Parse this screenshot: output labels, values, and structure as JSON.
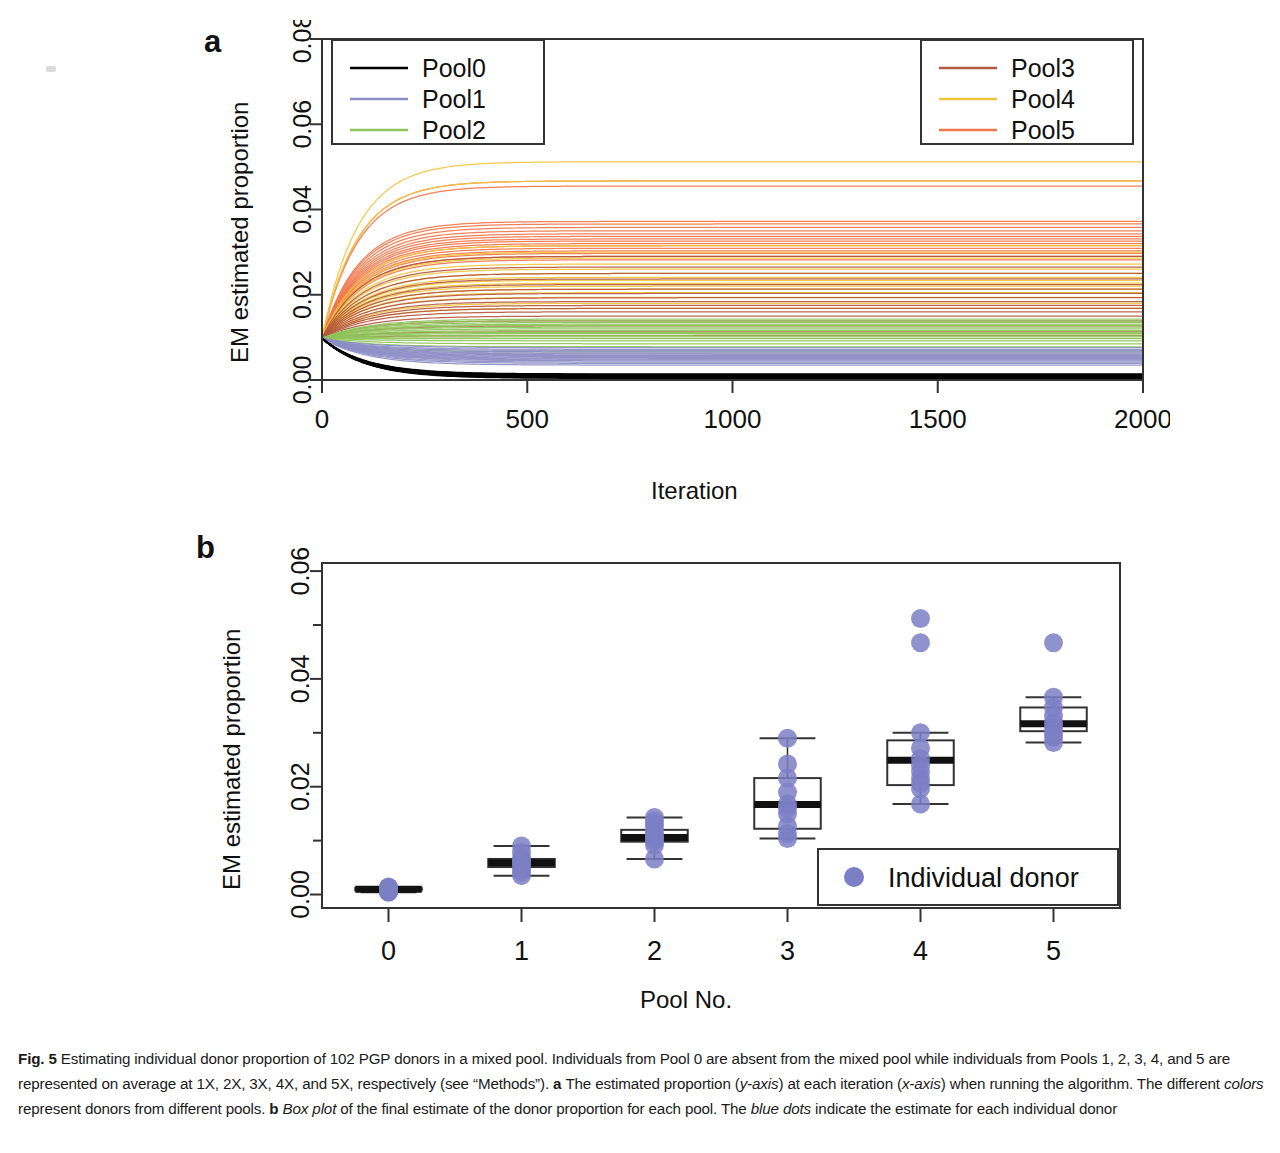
{
  "figure": {
    "label": "Fig. 5",
    "caption_parts": [
      {
        "text": "Fig. 5 ",
        "style": "bold"
      },
      {
        "text": "Estimating individual donor proportion of 102 PGP donors in a mixed pool. Individuals from Pool 0 are absent from the mixed pool while individuals from Pools 1, 2, 3, 4, and 5 are represented on average at 1X, 2X, 3X, 4X, and 5X, respectively (see “Methods”). ",
        "style": "normal"
      },
      {
        "text": "a ",
        "style": "bold"
      },
      {
        "text": "The estimated proportion (",
        "style": "normal"
      },
      {
        "text": "y-axis",
        "style": "italic"
      },
      {
        "text": ") at each iteration (",
        "style": "normal"
      },
      {
        "text": "x-axis",
        "style": "italic"
      },
      {
        "text": ") when running the algorithm. The different ",
        "style": "normal"
      },
      {
        "text": "colors",
        "style": "italic"
      },
      {
        "text": " represent donors from different pools. ",
        "style": "normal"
      },
      {
        "text": "b ",
        "style": "bold"
      },
      {
        "text": "Box plot",
        "style": "italic"
      },
      {
        "text": " of the final estimate of the donor proportion for each pool. The ",
        "style": "normal"
      },
      {
        "text": "blue dots",
        "style": "italic"
      },
      {
        "text": " indicate the estimate for each individual donor",
        "style": "normal"
      }
    ],
    "caption_plain": "Fig. 5 Estimating individual donor proportion of 102 PGP donors in a mixed pool. Individuals from Pool 0 are absent from the mixed pool while individuals from Pools 1, 2, 3, 4, and 5 are represented on average at 1X, 2X, 3X, 4X, and 5X, respectively (see “Methods”). a The estimated proportion (y-axis) at each iteration (x-axis) when running the algorithm. The different colors represent donors from different pools. b Box plot of the final estimate of the donor proportion for each pool. The blue dots indicate the estimate for each individual donor"
  },
  "panel_a": {
    "letter": "a",
    "ylabel": "EM estimated proportion",
    "xlabel": "Iteration",
    "legend_left": [
      {
        "label": "Pool0",
        "color": "#000000"
      },
      {
        "label": "Pool1",
        "color": "#8d8ec6"
      },
      {
        "label": "Pool2",
        "color": "#8ec45a"
      }
    ],
    "legend_right": [
      {
        "label": "Pool3",
        "color": "#b5583f"
      },
      {
        "label": "Pool4",
        "color": "#f2c53d"
      },
      {
        "label": "Pool5",
        "color": "#f0764a"
      }
    ]
  },
  "panel_b": {
    "letter": "b",
    "ylabel": "EM estimated proportion",
    "xlabel": "Pool No.",
    "legend": {
      "label": "Individual donor",
      "color": "#7b7fc4"
    }
  },
  "chart_data": [
    {
      "type": "line",
      "panel": "a",
      "title": "",
      "xlabel": "Iteration",
      "ylabel": "EM estimated proportion",
      "xlim": [
        0,
        2000
      ],
      "ylim": [
        0.0,
        0.08
      ],
      "xticks": [
        0,
        500,
        1000,
        1500,
        2000
      ],
      "xticklabels": [
        "0",
        "500",
        "1000",
        "1500",
        "2000"
      ],
      "yticks": [
        0.0,
        0.02,
        0.04,
        0.06,
        0.08
      ],
      "yticklabels": [
        "0.00",
        "0.02",
        "0.04",
        "0.06",
        "0.08"
      ],
      "grid": false,
      "legend_position": [
        "top-left",
        "top-right"
      ],
      "start_value": 0.0098,
      "description": "102 EM trajectories, all starting at 1/102 ≈ 0.0098 at iteration 0 and converging by ~iteration 400 to each donor's final proportion; curves are colored by donor pool.",
      "series": [
        {
          "name": "Pool0",
          "color": "#000000",
          "n_curves": 17,
          "final_values": [
            0.0004,
            0.0005,
            0.0006,
            0.0006,
            0.0007,
            0.0007,
            0.0008,
            0.0008,
            0.0009,
            0.0009,
            0.001,
            0.001,
            0.0011,
            0.0011,
            0.0012,
            0.0013,
            0.0014
          ]
        },
        {
          "name": "Pool1",
          "color": "#8d8ec6",
          "n_curves": 17,
          "final_values": [
            0.0035,
            0.0039,
            0.0042,
            0.0045,
            0.0047,
            0.0049,
            0.0051,
            0.0053,
            0.0055,
            0.0057,
            0.0059,
            0.0061,
            0.0063,
            0.0066,
            0.0069,
            0.0072,
            0.0076
          ]
        },
        {
          "name": "Pool2",
          "color": "#8ec45a",
          "n_curves": 17,
          "final_values": [
            0.0066,
            0.0078,
            0.0085,
            0.0092,
            0.0097,
            0.0101,
            0.0105,
            0.0109,
            0.0112,
            0.0116,
            0.012,
            0.0124,
            0.0128,
            0.0131,
            0.0135,
            0.0139,
            0.0143
          ]
        },
        {
          "name": "Pool3",
          "color": "#b5583f",
          "n_curves": 17,
          "final_values": [
            0.0104,
            0.0113,
            0.0127,
            0.0139,
            0.015,
            0.016,
            0.0168,
            0.0175,
            0.0184,
            0.0193,
            0.0203,
            0.0213,
            0.0224,
            0.0237,
            0.025,
            0.0265,
            0.029
          ]
        },
        {
          "name": "Pool4",
          "color": "#f2c53d",
          "n_curves": 17,
          "final_values": [
            0.0168,
            0.018,
            0.0194,
            0.0205,
            0.0213,
            0.022,
            0.0227,
            0.0234,
            0.0241,
            0.025,
            0.026,
            0.0272,
            0.0286,
            0.03,
            0.0315,
            0.0467,
            0.0512
          ]
        },
        {
          "name": "Pool5",
          "color": "#f0764a",
          "n_curves": 17,
          "final_values": [
            0.0282,
            0.029,
            0.0297,
            0.0303,
            0.0309,
            0.0315,
            0.032,
            0.0326,
            0.0331,
            0.0337,
            0.0343,
            0.035,
            0.0358,
            0.0366,
            0.0372,
            0.0455,
            0.0467
          ]
        }
      ]
    },
    {
      "type": "box",
      "panel": "b",
      "title": "",
      "xlabel": "Pool No.",
      "ylabel": "EM estimated proportion",
      "categories": [
        "0",
        "1",
        "2",
        "3",
        "4",
        "5"
      ],
      "ylim": [
        -0.0025,
        0.0615
      ],
      "yticks": [
        0.0,
        0.02,
        0.04,
        0.06
      ],
      "yticklabels": [
        "0.00",
        "0.02",
        "0.04",
        "0.06"
      ],
      "yminorticks": [
        0.01,
        0.03,
        0.05
      ],
      "grid": false,
      "legend_position": "bottom-right",
      "boxes": [
        {
          "category": "0",
          "whisker_low": 0.0004,
          "q1": 0.0008,
          "median": 0.001,
          "q3": 0.0012,
          "whisker_high": 0.0014,
          "points": [
            0.0004,
            0.0005,
            0.0006,
            0.0007,
            0.0008,
            0.0009,
            0.001,
            0.0011,
            0.0012,
            0.0013,
            0.0014
          ]
        },
        {
          "category": "1",
          "whisker_low": 0.0035,
          "q1": 0.0051,
          "median": 0.0059,
          "q3": 0.0066,
          "whisker_high": 0.009,
          "points": [
            0.0035,
            0.0042,
            0.0048,
            0.0053,
            0.0057,
            0.006,
            0.0064,
            0.0068,
            0.0078,
            0.009
          ]
        },
        {
          "category": "2",
          "whisker_low": 0.0066,
          "q1": 0.0098,
          "median": 0.0106,
          "q3": 0.012,
          "whisker_high": 0.0143,
          "points": [
            0.0066,
            0.0092,
            0.0099,
            0.0104,
            0.0108,
            0.0113,
            0.012,
            0.0128,
            0.0136,
            0.0143
          ]
        },
        {
          "category": "3",
          "whisker_low": 0.0104,
          "q1": 0.0122,
          "median": 0.0167,
          "q3": 0.0216,
          "whisker_high": 0.029,
          "points": [
            0.0104,
            0.0113,
            0.0127,
            0.015,
            0.016,
            0.0168,
            0.019,
            0.0216,
            0.0242,
            0.029
          ]
        },
        {
          "category": "4",
          "whisker_low": 0.0168,
          "q1": 0.0203,
          "median": 0.0249,
          "q3": 0.0286,
          "whisker_high": 0.03,
          "points": [
            0.0168,
            0.0196,
            0.0207,
            0.0216,
            0.0228,
            0.024,
            0.0252,
            0.0272,
            0.03,
            0.0467,
            0.0512
          ]
        },
        {
          "category": "5",
          "whisker_low": 0.0282,
          "q1": 0.0303,
          "median": 0.0317,
          "q3": 0.0347,
          "whisker_high": 0.0366,
          "points": [
            0.0282,
            0.0292,
            0.03,
            0.031,
            0.0318,
            0.0331,
            0.0347,
            0.0366,
            0.0467
          ]
        }
      ]
    }
  ]
}
